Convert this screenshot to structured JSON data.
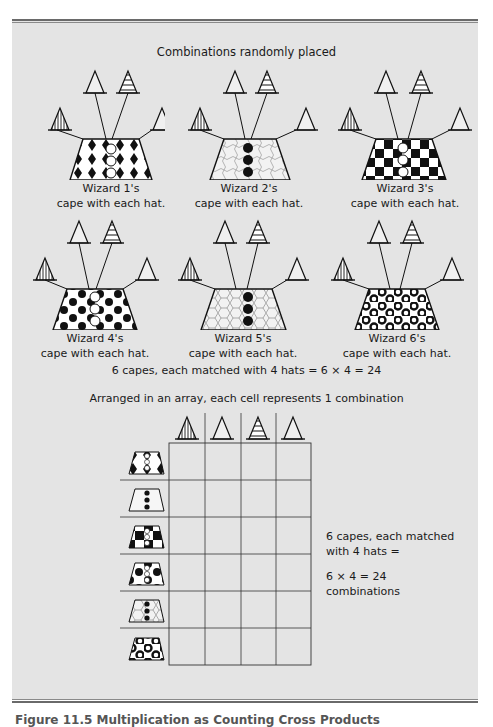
{
  "figure": {
    "top_title": "Combinations randomly placed",
    "wizards": [
      {
        "label": "Wizard 1's",
        "sublabel": "cape with each hat.",
        "pattern": "diamonds",
        "buttons": "hollow"
      },
      {
        "label": "Wizard 2's",
        "sublabel": "cape with each hat.",
        "pattern": "puzzle",
        "buttons": "filled"
      },
      {
        "label": "Wizard 3's",
        "sublabel": "cape with each hat.",
        "pattern": "checkerboard",
        "buttons": "hollow"
      },
      {
        "label": "Wizard 4's",
        "sublabel": "cape with each hat.",
        "pattern": "dots",
        "buttons": "hollow"
      },
      {
        "label": "Wizard 5's",
        "sublabel": "cape with each hat.",
        "pattern": "hexagons",
        "buttons": "filled"
      },
      {
        "label": "Wizard 6's",
        "sublabel": "cape with each hat.",
        "pattern": "rings",
        "buttons": "hollow"
      }
    ],
    "hats": [
      {
        "name": "vertical-striped-hat"
      },
      {
        "name": "plain-hat"
      },
      {
        "name": "horizontal-striped-hat"
      },
      {
        "name": "plain-hat-2"
      }
    ],
    "equation_line": "6 capes, each matched with 4 hats = 6 × 4 = 24",
    "array_title": "Arranged in an array, each cell represents 1 combination",
    "array": {
      "rows": 6,
      "cols": 4
    },
    "side_text": {
      "line1": "6 capes, each matched",
      "line2": "with 4 hats =",
      "line3": "6 × 4 = 24",
      "line4": "combinations"
    },
    "caption": "Figure 11.5   Multiplication as Counting Cross Products"
  }
}
